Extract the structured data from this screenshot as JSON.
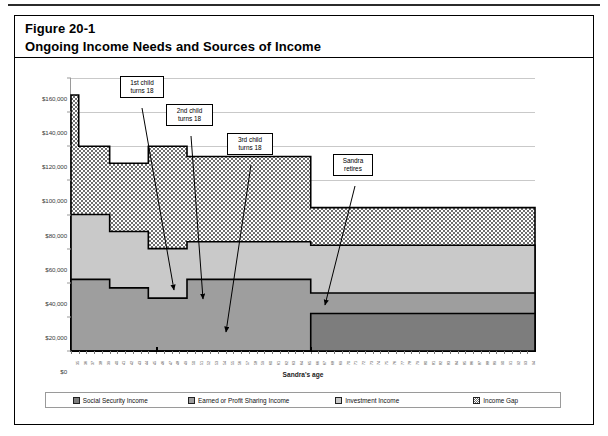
{
  "figure": {
    "number_label": "Figure 20-1",
    "title": "Ongoing Income Needs and Sources of Income"
  },
  "colors": {
    "social_security": "#7d7d7d",
    "earned": "#9e9e9e",
    "investment": "#c9c9c9",
    "income_gap": "#b0b0b0",
    "outline": "#000000",
    "gridline": "#c9c9c9"
  },
  "legend": {
    "items": [
      {
        "label": "Social Security Income",
        "swatch": "social_security"
      },
      {
        "label": "Earned or Profit Sharing Income",
        "swatch": "earned"
      },
      {
        "label": "Investment Income",
        "swatch": "investment"
      },
      {
        "label": "Income Gap",
        "swatch": "income_gap"
      }
    ]
  },
  "callouts": [
    {
      "id": "c1",
      "line1": "1st child",
      "line2": "turns 18"
    },
    {
      "id": "c2",
      "line1": "2nd child",
      "line2": "turns 18"
    },
    {
      "id": "c3",
      "line1": "3rd child",
      "line2": "turns 18"
    },
    {
      "id": "c4",
      "line1": "Sandra",
      "line2": "retires"
    }
  ],
  "chart_data": {
    "type": "area",
    "subtype": "stacked-step-area",
    "title": "Ongoing Income Needs and Sources of Income",
    "xlabel": "Sandra's age",
    "ylabel": "",
    "ylim": [
      0,
      160000
    ],
    "ytick_values": [
      0,
      20000,
      40000,
      60000,
      80000,
      100000,
      120000,
      140000,
      160000
    ],
    "ytick_labels": [
      "$0",
      "$20,000",
      "$40,000",
      "$60,000",
      "$80,000",
      "$100,000",
      "$120,000",
      "$140,000",
      "$160,000"
    ],
    "grid": true,
    "legend_position": "bottom",
    "x": [
      35,
      36,
      37,
      38,
      39,
      40,
      41,
      42,
      43,
      44,
      45,
      46,
      47,
      48,
      49,
      50,
      51,
      52,
      53,
      54,
      55,
      56,
      57,
      58,
      59,
      60,
      61,
      62,
      63,
      64,
      65,
      66,
      67,
      68,
      69,
      70,
      71,
      72,
      73,
      74,
      75,
      76,
      77,
      78,
      79,
      80,
      81,
      82,
      83,
      84,
      85,
      86,
      87,
      88,
      89,
      90,
      91,
      92,
      93,
      94
    ],
    "xtick_labels": [
      "35",
      "36",
      "37",
      "38",
      "39",
      "40",
      "41",
      "42",
      "43",
      "44",
      "45",
      "46",
      "47",
      "48",
      "49",
      "50",
      "51",
      "52",
      "53",
      "54",
      "55",
      "56",
      "57",
      "58",
      "59",
      "60",
      "61",
      "62",
      "63",
      "64",
      "65",
      "66",
      "67",
      "68",
      "69",
      "70",
      "71",
      "72",
      "73",
      "74",
      "75",
      "76",
      "77",
      "78",
      "79",
      "80",
      "81",
      "82",
      "83",
      "84",
      "85",
      "86",
      "87",
      "88",
      "89",
      "90",
      "91",
      "92",
      "93",
      "94"
    ],
    "major_xticks": [
      46,
      66
    ],
    "series": [
      {
        "name": "Social Security Income",
        "stack_order": 1,
        "values": [
          0,
          0,
          0,
          0,
          0,
          0,
          0,
          0,
          0,
          0,
          0,
          0,
          0,
          0,
          0,
          0,
          0,
          0,
          0,
          0,
          0,
          0,
          0,
          0,
          0,
          0,
          0,
          0,
          0,
          0,
          0,
          22000,
          22000,
          22000,
          22000,
          22000,
          22000,
          22000,
          22000,
          22000,
          22000,
          22000,
          22000,
          22000,
          22000,
          22000,
          22000,
          22000,
          22000,
          22000,
          22000,
          22000,
          22000,
          22000,
          22000,
          22000,
          22000,
          22000,
          22000,
          22000
        ]
      },
      {
        "name": "Earned or Profit Sharing Income",
        "stack_order": 2,
        "values": [
          42000,
          42000,
          42000,
          42000,
          42000,
          37000,
          37000,
          37000,
          37000,
          37000,
          31000,
          31000,
          31000,
          31000,
          31000,
          42000,
          42000,
          42000,
          42000,
          42000,
          42000,
          42000,
          42000,
          42000,
          42000,
          42000,
          42000,
          42000,
          42000,
          42000,
          42000,
          12000,
          12000,
          12000,
          12000,
          12000,
          12000,
          12000,
          12000,
          12000,
          12000,
          12000,
          12000,
          12000,
          12000,
          12000,
          12000,
          12000,
          12000,
          12000,
          12000,
          12000,
          12000,
          12000,
          12000,
          12000,
          12000,
          12000,
          12000,
          12000
        ]
      },
      {
        "name": "Investment Income",
        "stack_order": 3,
        "values": [
          38000,
          38000,
          38000,
          38000,
          38000,
          33000,
          33000,
          33000,
          33000,
          33000,
          29000,
          29000,
          29000,
          29000,
          29000,
          22000,
          22000,
          22000,
          22000,
          22000,
          22000,
          22000,
          22000,
          22000,
          22000,
          22000,
          22000,
          22000,
          22000,
          22000,
          22000,
          28000,
          28000,
          28000,
          28000,
          28000,
          28000,
          28000,
          28000,
          28000,
          28000,
          28000,
          28000,
          28000,
          28000,
          28000,
          28000,
          28000,
          28000,
          28000,
          28000,
          28000,
          28000,
          28000,
          28000,
          28000,
          28000,
          28000,
          28000,
          28000
        ]
      },
      {
        "name": "Income Gap",
        "stack_order": 4,
        "values": [
          70000,
          40000,
          40000,
          40000,
          40000,
          40000,
          40000,
          40000,
          40000,
          40000,
          60000,
          60000,
          60000,
          60000,
          60000,
          50000,
          50000,
          50000,
          50000,
          50000,
          50000,
          50000,
          50000,
          50000,
          50000,
          50000,
          50000,
          50000,
          50000,
          50000,
          50000,
          22000,
          22000,
          22000,
          22000,
          22000,
          22000,
          22000,
          22000,
          22000,
          22000,
          22000,
          22000,
          22000,
          22000,
          22000,
          22000,
          22000,
          22000,
          22000,
          22000,
          22000,
          22000,
          22000,
          22000,
          22000,
          22000,
          22000,
          22000,
          22000
        ]
      }
    ],
    "annotations": [
      {
        "text": "1st child turns 18",
        "x": 40,
        "y": 30000
      },
      {
        "text": "2nd child turns 18",
        "x": 45,
        "y": 29000
      },
      {
        "text": "3rd child turns 18",
        "x": 50,
        "y": 15000
      },
      {
        "text": "Sandra retires",
        "x": 66,
        "y": 34000
      }
    ]
  }
}
